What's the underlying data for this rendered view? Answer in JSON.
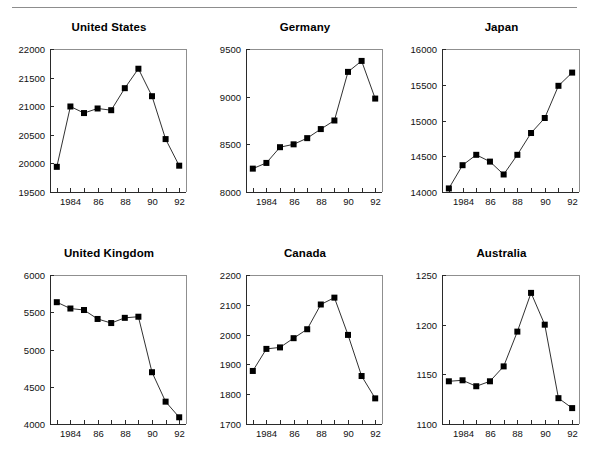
{
  "page": {
    "header_fragment": "",
    "background": "#ffffff"
  },
  "chart_data": {
    "type": "line",
    "layout": {
      "rows": 2,
      "cols": 3,
      "grid": false,
      "legend": null
    },
    "x": [
      1983,
      1984,
      1985,
      1986,
      1987,
      1988,
      1989,
      1990,
      1991,
      1992
    ],
    "xtick_positions": [
      1984,
      1986,
      1988,
      1990,
      1992
    ],
    "xtick_labels": [
      "1984",
      "86",
      "88",
      "90",
      "92"
    ],
    "xlabel": "",
    "panels": [
      {
        "title": "United States",
        "ylabel": "",
        "ylim": [
          19500,
          22000
        ],
        "yticks": [
          19500,
          20000,
          20500,
          21000,
          21500,
          22000
        ],
        "ytick_labels": [
          "19500",
          "20000",
          "20500",
          "21000",
          "21500",
          "22000"
        ],
        "values": [
          19940,
          20995,
          20880,
          20960,
          20930,
          21315,
          21655,
          21175,
          20425,
          19960
        ],
        "marker": "square"
      },
      {
        "title": "Germany",
        "ylabel": "",
        "ylim": [
          8000,
          9500
        ],
        "yticks": [
          8000,
          8500,
          9000,
          9500
        ],
        "ytick_labels": [
          "8000",
          "8500",
          "9000",
          "9500"
        ],
        "values": [
          8245,
          8305,
          8470,
          8500,
          8565,
          8660,
          8750,
          9260,
          9375,
          8980
        ],
        "marker": "square"
      },
      {
        "title": "Japan",
        "ylabel": "",
        "ylim": [
          14000,
          16000
        ],
        "yticks": [
          14000,
          14500,
          15000,
          15500,
          16000
        ],
        "ytick_labels": [
          "14000",
          "14500",
          "15000",
          "15500",
          "16000"
        ],
        "values": [
          14050,
          14375,
          14520,
          14425,
          14245,
          14520,
          14825,
          15035,
          15485,
          15670
        ],
        "marker": "square"
      },
      {
        "title": "United Kingdom",
        "ylabel": "",
        "ylim": [
          4000,
          6000
        ],
        "yticks": [
          4000,
          4500,
          5000,
          5500,
          6000
        ],
        "ytick_labels": [
          "4000",
          "4500",
          "5000",
          "5500",
          "6000"
        ],
        "values": [
          5635,
          5550,
          5530,
          5410,
          5355,
          5425,
          5440,
          4695,
          4300,
          4090
        ],
        "marker": "square"
      },
      {
        "title": "Canada",
        "ylabel": "",
        "ylim": [
          1700,
          2200
        ],
        "yticks": [
          1700,
          1800,
          1900,
          2000,
          2100,
          2200
        ],
        "ytick_labels": [
          "1700",
          "1800",
          "1900",
          "2000",
          "2100",
          "2200"
        ],
        "values": [
          1878,
          1952,
          1957,
          1988,
          2018,
          2101,
          2124,
          1999,
          1861,
          1786
        ],
        "marker": "square"
      },
      {
        "title": "Australia",
        "ylabel": "",
        "ylim": [
          1100,
          1250
        ],
        "yticks": [
          1100,
          1150,
          1200,
          1250
        ],
        "ytick_labels": [
          "1100",
          "1150",
          "1200",
          "1250"
        ],
        "values": [
          1143,
          1144,
          1138,
          1143,
          1158,
          1193,
          1232,
          1200,
          1126,
          1116
        ],
        "marker": "square"
      }
    ]
  }
}
